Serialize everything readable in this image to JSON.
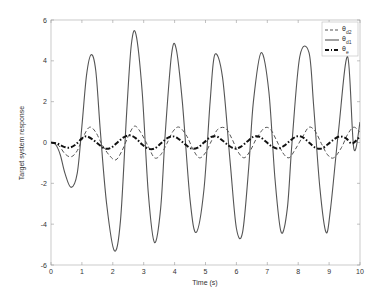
{
  "chart_data": {
    "type": "line",
    "title": "",
    "xlabel": "Time (s)",
    "ylabel": "Target system response",
    "xlim": [
      0,
      10
    ],
    "ylim": [
      -6,
      6
    ],
    "xticks": [
      0,
      1,
      2,
      3,
      4,
      5,
      6,
      7,
      8,
      9,
      10
    ],
    "yticks": [
      -6,
      -4,
      -2,
      0,
      2,
      4,
      6
    ],
    "grid": false,
    "legend_position": "upper right",
    "series": [
      {
        "name": "θd2",
        "label_main": "θ",
        "label_sub": "d2",
        "style": "dashed",
        "color": "#555555",
        "x": [
          0,
          0.25,
          0.45,
          0.65,
          0.85,
          1.05,
          1.25,
          1.45,
          1.65,
          1.9,
          2.1,
          2.3,
          2.5,
          2.7,
          2.9,
          3.15,
          3.35,
          3.55,
          3.75,
          3.95,
          4.15,
          4.4,
          4.6,
          4.8,
          5.0,
          5.2,
          5.4,
          5.65,
          5.85,
          6.05,
          6.25,
          6.45,
          6.65,
          6.9,
          7.1,
          7.3,
          7.5,
          7.7,
          7.9,
          8.15,
          8.35,
          8.55,
          8.75,
          8.95,
          9.15,
          9.4,
          9.6,
          9.8,
          10.0
        ],
        "y": [
          0,
          -0.15,
          -0.55,
          -0.7,
          -0.4,
          0.3,
          0.75,
          0.5,
          -0.1,
          -0.65,
          -0.85,
          -0.4,
          0.3,
          0.8,
          0.5,
          -0.2,
          -0.75,
          -0.6,
          -0.05,
          0.55,
          0.75,
          0.3,
          -0.35,
          -0.75,
          -0.5,
          0.1,
          0.65,
          0.7,
          0.2,
          -0.45,
          -0.75,
          -0.4,
          0.2,
          0.7,
          0.65,
          0.1,
          -0.5,
          -0.75,
          -0.35,
          0.3,
          0.75,
          0.55,
          -0.05,
          -0.6,
          -0.75,
          -0.25,
          0.4,
          0.75,
          0.5
        ]
      },
      {
        "name": "θd1",
        "label_main": "θ",
        "label_sub": "d1",
        "style": "solid",
        "color": "#555555",
        "x": [
          0,
          0.15,
          0.3,
          0.45,
          0.65,
          0.85,
          1.0,
          1.15,
          1.3,
          1.45,
          1.6,
          1.8,
          2.05,
          2.25,
          2.45,
          2.6,
          2.75,
          2.95,
          3.15,
          3.35,
          3.55,
          3.7,
          3.9,
          4.05,
          4.25,
          4.5,
          4.7,
          4.95,
          5.15,
          5.3,
          5.55,
          5.8,
          6.0,
          6.2,
          6.4,
          6.55,
          6.8,
          7.05,
          7.25,
          7.45,
          7.65,
          7.8,
          8.05,
          8.35,
          8.5,
          8.7,
          8.9,
          9.05,
          9.3,
          9.6,
          9.8,
          10.0
        ],
        "y": [
          0,
          -0.1,
          -0.6,
          -1.5,
          -2.2,
          -1.5,
          0.8,
          3.3,
          4.3,
          3.5,
          0.5,
          -3.0,
          -5.3,
          -3.8,
          1.5,
          4.8,
          5.3,
          2.5,
          -2.5,
          -4.9,
          -3.2,
          0.5,
          4.3,
          4.6,
          2.0,
          -2.8,
          -4.4,
          -2.3,
          2.0,
          4.3,
          3.2,
          -1.0,
          -4.2,
          -4.4,
          -1.2,
          2.0,
          4.4,
          2.5,
          -1.8,
          -4.4,
          -3.2,
          0.0,
          4.2,
          4.4,
          1.8,
          -2.2,
          -4.4,
          -3.2,
          0.5,
          4.2,
          -0.3,
          1.0
        ]
      },
      {
        "name": "θe",
        "label_main": "θ",
        "label_sub": "e",
        "style": "dashdot",
        "color": "#111111",
        "x": [
          0,
          0.2,
          0.4,
          0.6,
          0.8,
          1.0,
          1.15,
          1.35,
          1.55,
          1.75,
          1.95,
          2.15,
          2.35,
          2.55,
          2.75,
          2.95,
          3.15,
          3.35,
          3.55,
          3.75,
          3.95,
          4.15,
          4.35,
          4.55,
          4.75,
          4.95,
          5.15,
          5.35,
          5.55,
          5.75,
          5.95,
          6.15,
          6.35,
          6.55,
          6.75,
          6.95,
          7.15,
          7.35,
          7.55,
          7.75,
          7.95,
          8.15,
          8.35,
          8.55,
          8.75,
          8.95,
          9.15,
          9.35,
          9.55,
          9.75,
          10.0
        ],
        "y": [
          0,
          -0.05,
          -0.2,
          -0.25,
          -0.1,
          0.2,
          0.3,
          0.15,
          -0.1,
          -0.3,
          -0.25,
          0.0,
          0.25,
          0.35,
          0.2,
          -0.1,
          -0.3,
          -0.3,
          -0.05,
          0.2,
          0.3,
          0.15,
          -0.1,
          -0.3,
          -0.25,
          0.0,
          0.25,
          0.3,
          0.1,
          -0.15,
          -0.3,
          -0.2,
          0.05,
          0.28,
          0.28,
          0.05,
          -0.2,
          -0.3,
          -0.15,
          0.1,
          0.3,
          0.25,
          0.0,
          -0.25,
          -0.3,
          -0.1,
          0.15,
          0.3,
          0.2,
          -0.05,
          0.3
        ]
      }
    ]
  }
}
